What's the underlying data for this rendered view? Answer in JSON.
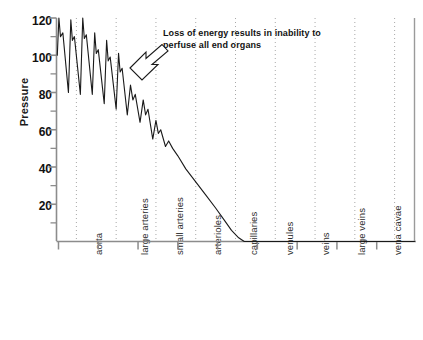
{
  "chart_data": {
    "type": "line",
    "title": "",
    "subtitle": "",
    "xlabel": "",
    "ylabel": "Pressure",
    "ylim": [
      0,
      120
    ],
    "xlim": [
      0,
      9
    ],
    "grid": true,
    "grid_style": "vertical dotted gridlines at each vessel boundary",
    "legend": "none",
    "y_major_ticks": [
      20,
      40,
      60,
      80,
      100,
      120
    ],
    "y_minor_ticks": [
      10,
      30,
      50,
      70,
      90,
      110
    ],
    "y_tick_labels": [
      "20",
      "40",
      "60",
      "80",
      "100",
      "120"
    ],
    "categories": [
      "aorta",
      "large arteries",
      "small arteries",
      "arterioles",
      "capillaries",
      "venules",
      "veins",
      "large veins",
      "vena cavae"
    ],
    "series": [
      {
        "name": "Arterial pressure waveform",
        "description": "Pulsatile arterial pressure that damps from 120/80 mmHg in the aorta to 0 at the capillaries, then remains flat through the venous system.",
        "color": "#1a1a1a",
        "points": [
          {
            "x": 0.02,
            "y": 100
          },
          {
            "x": 0.06,
            "y": 120
          },
          {
            "x": 0.1,
            "y": 110
          },
          {
            "x": 0.16,
            "y": 112
          },
          {
            "x": 0.3,
            "y": 80
          },
          {
            "x": 0.36,
            "y": 119
          },
          {
            "x": 0.4,
            "y": 108
          },
          {
            "x": 0.45,
            "y": 110
          },
          {
            "x": 0.6,
            "y": 79
          },
          {
            "x": 0.66,
            "y": 120
          },
          {
            "x": 0.7,
            "y": 109
          },
          {
            "x": 0.75,
            "y": 111
          },
          {
            "x": 0.9,
            "y": 79
          },
          {
            "x": 0.96,
            "y": 112
          },
          {
            "x": 1.0,
            "y": 101
          },
          {
            "x": 1.05,
            "y": 103
          },
          {
            "x": 1.2,
            "y": 74
          },
          {
            "x": 1.26,
            "y": 108
          },
          {
            "x": 1.3,
            "y": 97
          },
          {
            "x": 1.35,
            "y": 99
          },
          {
            "x": 1.5,
            "y": 71
          },
          {
            "x": 1.56,
            "y": 101
          },
          {
            "x": 1.6,
            "y": 91
          },
          {
            "x": 1.65,
            "y": 93
          },
          {
            "x": 1.78,
            "y": 68
          },
          {
            "x": 1.86,
            "y": 84
          },
          {
            "x": 1.92,
            "y": 76
          },
          {
            "x": 1.98,
            "y": 79
          },
          {
            "x": 2.1,
            "y": 64
          },
          {
            "x": 2.18,
            "y": 76
          },
          {
            "x": 2.24,
            "y": 68
          },
          {
            "x": 2.3,
            "y": 71
          },
          {
            "x": 2.42,
            "y": 55
          },
          {
            "x": 2.5,
            "y": 65
          },
          {
            "x": 2.56,
            "y": 58
          },
          {
            "x": 2.62,
            "y": 60
          },
          {
            "x": 2.74,
            "y": 51
          },
          {
            "x": 2.82,
            "y": 54
          },
          {
            "x": 2.92,
            "y": 50
          },
          {
            "x": 3.05,
            "y": 46
          },
          {
            "x": 3.25,
            "y": 39
          },
          {
            "x": 3.5,
            "y": 32
          },
          {
            "x": 3.75,
            "y": 25
          },
          {
            "x": 4.0,
            "y": 18
          },
          {
            "x": 4.2,
            "y": 12
          },
          {
            "x": 4.4,
            "y": 6
          },
          {
            "x": 4.58,
            "y": 2
          },
          {
            "x": 4.72,
            "y": 0
          },
          {
            "x": 9.0,
            "y": 0
          }
        ]
      }
    ],
    "annotations": [
      {
        "text_line1": "Loss of energy results in inability to",
        "text_line2": "perfuse all end organs",
        "arrow": "outlined-arrow pointing down-left toward the damping arterial waveform",
        "target_x": 1.55,
        "target_y": 102
      }
    ]
  },
  "axes": {
    "ylabel": "Pressure",
    "y_ticks": [
      {
        "value": 120,
        "label": "120"
      },
      {
        "value": 100,
        "label": "100"
      },
      {
        "value": 80,
        "label": "80"
      },
      {
        "value": 60,
        "label": "60"
      },
      {
        "value": 40,
        "label": "40"
      },
      {
        "value": 20,
        "label": "20"
      }
    ],
    "x_categories": [
      {
        "label": "aorta"
      },
      {
        "label": "large arteries"
      },
      {
        "label": "small arteries"
      },
      {
        "label": "arterioles"
      },
      {
        "label": "capillaries"
      },
      {
        "label": "venules"
      },
      {
        "label": "veins"
      },
      {
        "label": "large veins"
      },
      {
        "label": "vena cavae"
      }
    ]
  },
  "annotation": {
    "line1": "Loss of energy results in inability to",
    "line2": "perfuse all end organs"
  },
  "colors": {
    "curve": "#1a1a1a",
    "axis": "#8c8c8c",
    "gridline": "#a8a8a8",
    "text": "#111111",
    "background": "#ffffff"
  }
}
